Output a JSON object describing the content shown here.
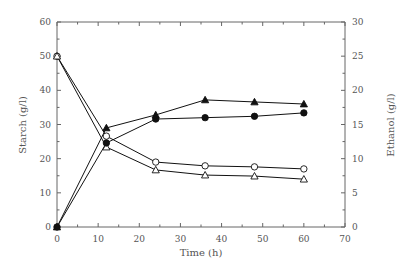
{
  "chart_data": {
    "type": "line",
    "title": "",
    "xlabel": "Time (h)",
    "ylabel": "Starch (g/l)",
    "y2label": "Ethanol (g/l)",
    "xlim": [
      0,
      70
    ],
    "ylim": [
      0,
      60
    ],
    "y2lim": [
      0,
      30
    ],
    "xticks": [
      0,
      10,
      20,
      30,
      40,
      50,
      60,
      70
    ],
    "yticks": [
      0,
      10,
      20,
      30,
      40,
      50,
      60
    ],
    "y2ticks": [
      0,
      5,
      10,
      15,
      20,
      25,
      30
    ],
    "grid": false,
    "legend": null,
    "x": [
      0,
      12,
      24,
      36,
      48,
      60
    ],
    "series": [
      {
        "name": "Starch (open circle)",
        "axis": "left",
        "marker": "open-circle",
        "values": [
          50,
          26.6,
          19.0,
          17.9,
          17.6,
          17.0
        ]
      },
      {
        "name": "Starch (open triangle)",
        "axis": "left",
        "marker": "open-triangle",
        "values": [
          50,
          23.4,
          16.7,
          15.2,
          14.9,
          14.0
        ]
      },
      {
        "name": "Ethanol (filled circle)",
        "axis": "right",
        "marker": "filled-circle",
        "values": [
          0,
          12.3,
          15.8,
          16.0,
          16.2,
          16.7
        ]
      },
      {
        "name": "Ethanol (filled triangle)",
        "axis": "right",
        "marker": "filled-triangle",
        "values": [
          0,
          14.5,
          16.4,
          18.6,
          18.3,
          18.0
        ]
      }
    ]
  }
}
